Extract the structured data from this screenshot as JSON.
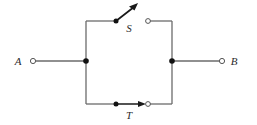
{
  "figure": {
    "kind": "circuit-diagram",
    "title": "",
    "width": 257,
    "height": 125,
    "background_color": "#ffffff"
  },
  "colors": {
    "wire": "#6b6b6b",
    "wire_dark": "#1a1a1a",
    "node_fill": "#111111",
    "terminal_stroke": "#555555",
    "terminal_fill": "#ffffff",
    "label_text": "#2b2b2b"
  },
  "terminals": [
    {
      "id": "A",
      "label": "A",
      "marker": "open-circle",
      "x": 33,
      "y": 61,
      "label_x": 18,
      "label_y": 65
    },
    {
      "id": "B",
      "label": "B",
      "marker": "open-circle",
      "x": 222,
      "y": 61,
      "label_x": 232,
      "label_y": 65
    }
  ],
  "switches": [
    {
      "id": "S",
      "label": "S",
      "state": "open",
      "position": "top",
      "pivot_x": 116,
      "pivot_y": 21,
      "contact_x": 148,
      "contact_y": 21,
      "blade_tip_x": 136,
      "blade_tip_y": 5,
      "label_x": 128,
      "label_y": 31,
      "has_arrowhead": true
    },
    {
      "id": "T",
      "label": "T",
      "state": "closed",
      "position": "bottom",
      "pivot_x": 116,
      "pivot_y": 104,
      "contact_x": 148,
      "contact_y": 104,
      "blade_tip_x": 145,
      "blade_tip_y": 104,
      "label_x": 128,
      "label_y": 118,
      "has_arrowhead": true
    }
  ],
  "junctions": [
    {
      "id": "left-node",
      "x": 86,
      "y": 61,
      "marker": "filled-dot"
    },
    {
      "id": "right-node",
      "x": 172,
      "y": 61,
      "marker": "filled-dot"
    }
  ],
  "loop": {
    "left_x": 86,
    "right_x": 172,
    "top_y": 21,
    "bottom_y": 104
  },
  "wires": [
    {
      "id": "lead-a",
      "from": "A",
      "to": "left-node"
    },
    {
      "id": "lead-b",
      "from": "right-node",
      "to": "B"
    },
    {
      "id": "left-rail",
      "from": "top-left",
      "to": "bottom-left"
    },
    {
      "id": "right-rail",
      "from": "top-right",
      "to": "bottom-right"
    },
    {
      "id": "top-left-run",
      "from": "top-left",
      "to": "switch-S-pivot"
    },
    {
      "id": "top-right-run",
      "from": "switch-S-contact",
      "to": "top-right"
    },
    {
      "id": "bottom-left-run",
      "from": "bottom-left",
      "to": "switch-T-pivot"
    },
    {
      "id": "bottom-right-run",
      "from": "switch-T-contact",
      "to": "bottom-right"
    }
  ]
}
